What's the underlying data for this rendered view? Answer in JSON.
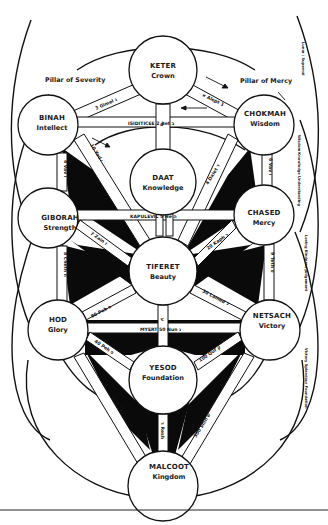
{
  "diagram": {
    "pillars": {
      "left": "Pillar of Severity",
      "right": "Pillar of Mercy"
    },
    "sephirot": [
      {
        "id": "keter",
        "name": "KETER",
        "meaning": "Crown",
        "cx": 163,
        "cy": 70,
        "r": 34
      },
      {
        "id": "binah",
        "name": "BINAH",
        "meaning": "Intellect",
        "cx": 48,
        "cy": 125,
        "r": 30
      },
      {
        "id": "chokmah",
        "name": "CHOKMAH",
        "meaning": "Wisdom",
        "cx": 264,
        "cy": 125,
        "r": 30
      },
      {
        "id": "daat",
        "name": "DAAT",
        "meaning": "Knowledge",
        "cx": 163,
        "cy": 182,
        "r": 33
      },
      {
        "id": "giborah",
        "name": "GIBORAH",
        "meaning": "Strength",
        "cx": 48,
        "cy": 218,
        "r": 30
      },
      {
        "id": "chased",
        "name": "CHASED",
        "meaning": "Mercy",
        "cx": 264,
        "cy": 215,
        "r": 30
      },
      {
        "id": "tiferet",
        "name": "TIFERET",
        "meaning": "Beauty",
        "cx": 163,
        "cy": 271,
        "r": 34
      },
      {
        "id": "hod",
        "name": "HOD",
        "meaning": "Glory",
        "cx": 58,
        "cy": 330,
        "r": 30
      },
      {
        "id": "netsach",
        "name": "NETSACH",
        "meaning": "Victory",
        "cx": 270,
        "cy": 330,
        "r": 30
      },
      {
        "id": "yesod",
        "name": "YESOD",
        "meaning": "Foundation",
        "cx": 163,
        "cy": 380,
        "r": 34
      },
      {
        "id": "malcoot",
        "name": "MALCOOT",
        "meaning": "Kingdom",
        "cx": 163,
        "cy": 486,
        "r": 35
      }
    ],
    "paths": [
      {
        "from": "keter",
        "to": "binah",
        "label": "3 Gimel ג"
      },
      {
        "from": "keter",
        "to": "chokmah",
        "label": "א Alept 1"
      },
      {
        "from": "binah",
        "to": "chokmah",
        "label": "ISIDITICEE  2 Bet ב"
      },
      {
        "from": "keter",
        "to": "daat",
        "label": "ם"
      },
      {
        "from": "binah",
        "to": "giborah",
        "label": "4 Vav ו"
      },
      {
        "from": "binah",
        "to": "tiferet",
        "label": "10 Yod י"
      },
      {
        "from": "chokmah",
        "to": "tiferet",
        "label": "4 Dalet ד"
      },
      {
        "from": "chokmah",
        "to": "chased",
        "label": "6 Vav ו"
      },
      {
        "from": "giborah",
        "to": "chased",
        "label": "KAPULEVIL  5 He ה"
      },
      {
        "from": "giborah",
        "to": "tiferet",
        "label": "7 Zain ז"
      },
      {
        "from": "chased",
        "to": "tiferet",
        "label": "20 Kaph כ"
      },
      {
        "from": "giborah",
        "to": "hod",
        "label": "8 Cheth ח"
      },
      {
        "from": "chased",
        "to": "netsach",
        "label": "9 Teth ט"
      },
      {
        "from": "tiferet",
        "to": "hod",
        "label": "80 Peh פ"
      },
      {
        "from": "tiferet",
        "to": "netsach",
        "label": "30 Lamed ל"
      },
      {
        "from": "hod",
        "to": "netsach",
        "label": "MYERT  50 Nun נ"
      },
      {
        "from": "tiferet",
        "to": "yesod",
        "label": "ע"
      },
      {
        "from": "hod",
        "to": "yesod",
        "label": "40 Peh פ"
      },
      {
        "from": "netsach",
        "to": "yesod",
        "label": "100 Quf ק"
      },
      {
        "from": "hod",
        "to": "malcoot",
        "label": "400 Tav ת"
      },
      {
        "from": "netsach",
        "to": "malcoot",
        "label": "300 Shin ש"
      },
      {
        "from": "yesod",
        "to": "malcoot",
        "label": "ר Resh"
      }
    ],
    "side_captions": {
      "right_top": "Lunar / Supernal",
      "right_mid_upper": "Wisdom Knowledge Understanding",
      "right_mid": "Loving Kindness Judgement",
      "right_low": "Victory Splendour Foundation"
    }
  }
}
